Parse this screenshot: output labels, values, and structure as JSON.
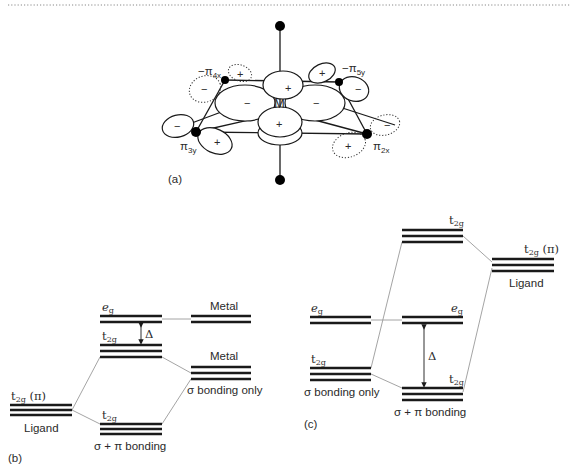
{
  "figure": {
    "panel_a": {
      "label": "(a)",
      "center_label": "M",
      "ligand_orbitals": [
        {
          "prefix": "−π",
          "sub": "4x"
        },
        {
          "prefix": "−π",
          "sub": "5y"
        },
        {
          "prefix": "π",
          "sub": "3y"
        },
        {
          "prefix": "π",
          "sub": "2x"
        }
      ],
      "signs": {
        "plus": "+",
        "minus": "−"
      }
    },
    "panel_b": {
      "label": "(b)",
      "levels": {
        "ligand_t2g": {
          "main": "t",
          "sub": "2g",
          "suffix": " (π)",
          "caption": "Ligand"
        },
        "complex_eg": {
          "main": "e",
          "sub": "g"
        },
        "complex_t2g_upper": {
          "main": "t",
          "sub": "2g"
        },
        "complex_t2g_lower": {
          "main": "t",
          "sub": "2g",
          "caption": "σ  + π bonding"
        },
        "metal_eg": {
          "caption": "Metal"
        },
        "metal_sigma": {
          "title": "Metal",
          "caption": "σ bonding only"
        }
      },
      "delta": "Δ"
    },
    "panel_c": {
      "label": "(c)",
      "levels": {
        "sigma_eg": {
          "main": "e",
          "sub": "g"
        },
        "sigma_t2g": {
          "main": "t",
          "sub": "2g",
          "caption": "σ bonding only"
        },
        "complex_t2g_upper": {
          "main": "t",
          "sub": "2g"
        },
        "complex_eg": {
          "main": "e",
          "sub": "g"
        },
        "complex_t2g_lower": {
          "main": "t",
          "sub": "2g",
          "caption": "σ  + π bonding"
        },
        "ligand_t2g": {
          "main": "t",
          "sub": "2g",
          "suffix": " (π)",
          "caption": "Ligand"
        }
      },
      "delta": "Δ"
    }
  }
}
